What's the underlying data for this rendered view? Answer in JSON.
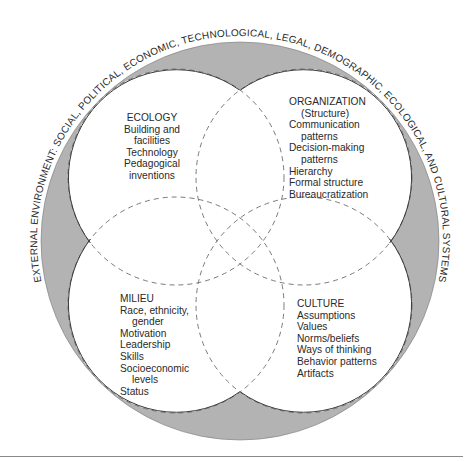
{
  "outer_ring": {
    "label": "EXTERNAL ENVIRONMENT: SOCIAL, POLITICAL, ECONOMIC, TECHNOLOGICAL, LEGAL, DEMOGRAPHIC, ECOLOGICAL, AND CULTURAL SYSTEMS",
    "fill_color": "#b3b3b3"
  },
  "quadrants": {
    "ecology": {
      "title": "ECOLOGY",
      "items": [
        "Building and",
        "facilities",
        "Technology",
        "Pedagogical",
        "inventions"
      ]
    },
    "organization": {
      "title": "ORGANIZATION",
      "items": [
        "(Structure)",
        "Communication",
        "patterns",
        "Decision-making",
        "patterns",
        "Hierarchy",
        "Formal structure",
        "Bureaucratization"
      ]
    },
    "milieu": {
      "title": "MILIEU",
      "items": [
        "Race, ethnicity,",
        "gender",
        "Motivation",
        "Leadership",
        "Skills",
        "Socioeconomic",
        "levels",
        "Status"
      ]
    },
    "culture": {
      "title": "CULTURE",
      "items": [
        "Assumptions",
        "Values",
        "Norms/beliefs",
        "Ways of thinking",
        "Behavior patterns",
        "Artifacts"
      ]
    }
  }
}
